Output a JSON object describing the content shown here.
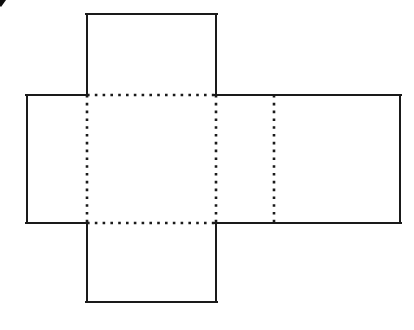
{
  "figure": {
    "kind": "geometry-net-diagram",
    "canvas": {
      "width": 414,
      "height": 330,
      "background": "#ffffff"
    },
    "style": {
      "solid_stroke_color": "#1a1a1a",
      "solid_stroke_width": 2,
      "fold_stroke_color": "#1a1a1a",
      "fold_stroke_width": 2.6,
      "fold_dash_pattern": "2.6 5.2",
      "face_fill": "#ffffff"
    },
    "faces": [
      {
        "name": "top-flap",
        "label": "",
        "x": 87,
        "y": 14,
        "width": 129,
        "height": 81
      },
      {
        "name": "left-face",
        "label": "",
        "x": 27,
        "y": 95,
        "width": 60,
        "height": 128
      },
      {
        "name": "center-face",
        "label": "",
        "x": 87,
        "y": 95,
        "width": 129,
        "height": 128
      },
      {
        "name": "right-face",
        "label": "",
        "x": 216,
        "y": 95,
        "width": 184,
        "height": 128
      },
      {
        "name": "bottom-flap",
        "label": "",
        "x": 87,
        "y": 223,
        "width": 129,
        "height": 79
      }
    ],
    "solid_edges": [
      {
        "name": "top-flap-left-edge",
        "x1": 87,
        "y1": 14,
        "x2": 87,
        "y2": 95
      },
      {
        "name": "top-flap-top-edge",
        "x1": 87,
        "y1": 14,
        "x2": 216,
        "y2": 14
      },
      {
        "name": "top-flap-right-edge",
        "x1": 216,
        "y1": 14,
        "x2": 216,
        "y2": 95
      },
      {
        "name": "band-top-left-segment",
        "x1": 27,
        "y1": 95,
        "x2": 87,
        "y2": 95
      },
      {
        "name": "band-top-right-segment",
        "x1": 216,
        "y1": 95,
        "x2": 400,
        "y2": 95
      },
      {
        "name": "left-face-left-edge",
        "x1": 27,
        "y1": 95,
        "x2": 27,
        "y2": 223
      },
      {
        "name": "right-face-right-edge",
        "x1": 400,
        "y1": 95,
        "x2": 400,
        "y2": 223
      },
      {
        "name": "band-bottom-left-segment",
        "x1": 27,
        "y1": 223,
        "x2": 87,
        "y2": 223
      },
      {
        "name": "band-bottom-right-segment",
        "x1": 216,
        "y1": 223,
        "x2": 400,
        "y2": 223
      },
      {
        "name": "bottom-flap-left-edge",
        "x1": 87,
        "y1": 223,
        "x2": 87,
        "y2": 302
      },
      {
        "name": "bottom-flap-bottom-edge",
        "x1": 87,
        "y1": 302,
        "x2": 216,
        "y2": 302
      },
      {
        "name": "bottom-flap-right-edge",
        "x1": 216,
        "y1": 223,
        "x2": 216,
        "y2": 302
      }
    ],
    "fold_edges": [
      {
        "name": "fold-center-top",
        "x1": 87,
        "y1": 95,
        "x2": 216,
        "y2": 95
      },
      {
        "name": "fold-center-bottom",
        "x1": 87,
        "y1": 223,
        "x2": 216,
        "y2": 223
      },
      {
        "name": "fold-center-left",
        "x1": 87,
        "y1": 95,
        "x2": 87,
        "y2": 223
      },
      {
        "name": "fold-center-right",
        "x1": 216,
        "y1": 95,
        "x2": 216,
        "y2": 223
      },
      {
        "name": "fold-right-face",
        "x1": 274,
        "y1": 95,
        "x2": 274,
        "y2": 223
      }
    ],
    "corner_artifact": {
      "name": "scan-artifact-arc",
      "color": "#0d0d0d",
      "cx": 2,
      "cy": 1,
      "r": 14
    }
  }
}
